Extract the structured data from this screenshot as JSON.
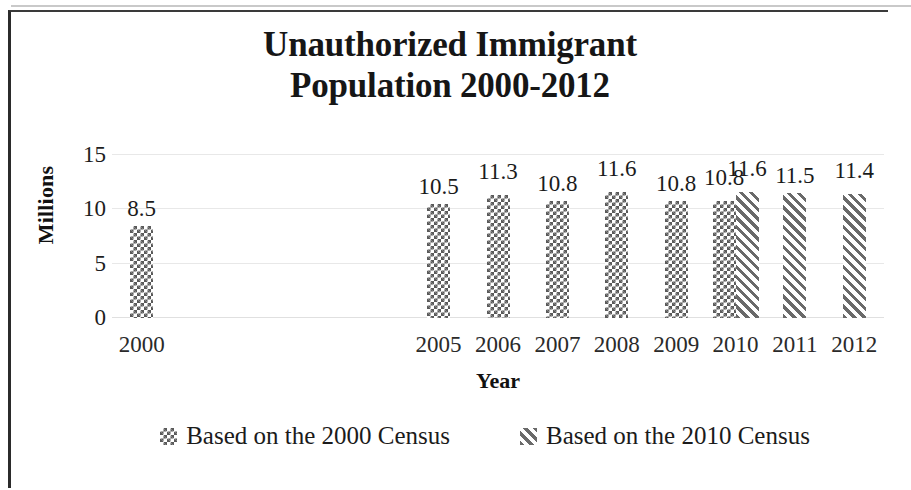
{
  "chart_data": {
    "type": "bar",
    "title": "Unauthorized Immigrant Population 2000-2012",
    "title_line1": "Unauthorized Immigrant",
    "title_line2": "Population 2000-2012",
    "xlabel": "Year",
    "ylabel": "Millions",
    "ylim": [
      0,
      15
    ],
    "yticks": [
      "0",
      "5",
      "10",
      "15"
    ],
    "ytick_values": [
      0,
      5,
      10,
      15
    ],
    "grid": true,
    "legend_position": "bottom",
    "categories": [
      "2000",
      "2001",
      "2002",
      "2003",
      "2004",
      "2005",
      "2006",
      "2007",
      "2008",
      "2009",
      "2010",
      "2011",
      "2012"
    ],
    "visible_tick_labels": [
      "2000",
      "2005",
      "2006",
      "2007",
      "2008",
      "2009",
      "2010",
      "2011",
      "2012"
    ],
    "series": [
      {
        "name": "Based on the 2000 Census",
        "pattern": "checkered",
        "values": [
          8.5,
          null,
          null,
          null,
          null,
          10.5,
          11.3,
          10.8,
          11.6,
          10.8,
          10.8,
          null,
          null
        ],
        "labels": [
          "8.5",
          "",
          "",
          "",
          "",
          "10.5",
          "11.3",
          "10.8",
          "11.6",
          "10.8",
          "10.8",
          "",
          ""
        ]
      },
      {
        "name": "Based on the 2010 Census",
        "pattern": "diagonal-hatch",
        "values": [
          null,
          null,
          null,
          null,
          null,
          null,
          null,
          null,
          null,
          null,
          11.6,
          11.5,
          11.4
        ],
        "labels": [
          "",
          "",
          "",
          "",
          "",
          "",
          "",
          "",
          "",
          "",
          "11.6",
          "11.5",
          "11.4"
        ]
      }
    ]
  },
  "legend": {
    "items": [
      {
        "label": "Based on the 2000 Census",
        "pattern": "checkered"
      },
      {
        "label": "Based on the 2010 Census",
        "pattern": "diagonal-hatch"
      }
    ]
  },
  "colors": {
    "pattern_ink": "#5a5a5a",
    "text": "#1b1b1b",
    "gridline": "#e8e8e8",
    "frame": "#2b2b2b",
    "background": "#ffffff"
  }
}
